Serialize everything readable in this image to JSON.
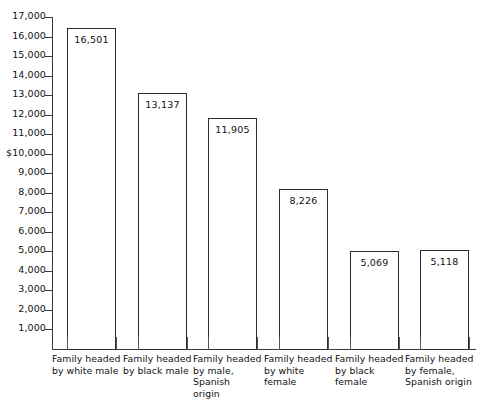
{
  "chart_data": {
    "type": "bar",
    "title": "",
    "subtitle": "",
    "xlabel": "",
    "ylabel": "",
    "ylim": [
      0,
      17000
    ],
    "grid": false,
    "legend": "none",
    "y_ticks": [
      "1,000",
      "2,000",
      "3,000",
      "4,000",
      "5,000",
      "6,000",
      "7,000",
      "8,000",
      "9,000",
      "$10,000",
      "11,000",
      "12,000",
      "13,000",
      "14,000",
      "15,000",
      "16,000",
      "17,000"
    ],
    "y_tick_values": [
      1000,
      2000,
      3000,
      4000,
      5000,
      6000,
      7000,
      8000,
      9000,
      10000,
      11000,
      12000,
      13000,
      14000,
      15000,
      16000,
      17000
    ],
    "categories": [
      "Family headed\nby white male",
      "Family headed\nby black male",
      "Family headed\nby male, Spanish\norigin",
      "Family headed\nby white female",
      "Family headed\nby black female",
      "Family headed\nby female,\nSpanish origin"
    ],
    "category_lines": [
      [
        "Family headed",
        "by white male"
      ],
      [
        "Family headed",
        "by black male"
      ],
      [
        "Family headed",
        "by male, Spanish",
        "origin"
      ],
      [
        "Family headed",
        "by white female"
      ],
      [
        "Family headed",
        "by black female"
      ],
      [
        "Family headed",
        "by female,",
        "Spanish origin"
      ]
    ],
    "values": [
      16501,
      13137,
      11905,
      8226,
      5069,
      5118
    ],
    "value_labels": [
      "16,501",
      "13,137",
      "11,905",
      "8,226",
      "5,069",
      "5,118"
    ],
    "bar_fill": "#ffffff",
    "bar_stroke": "#2b2b2b",
    "axis_color": "#3a3a3a",
    "background": "#ffffff"
  }
}
